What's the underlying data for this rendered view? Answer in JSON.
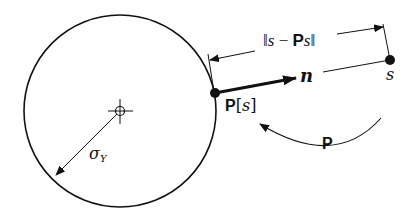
{
  "figure": {
    "colors": {
      "stroke": "#111111",
      "background": "#ffffff"
    },
    "circle": {
      "center": [
        120,
        111
      ],
      "radius": 96
    },
    "center_marker": {
      "icon": "crosshair-circle-icon"
    },
    "radius_label": {
      "symbol": "σ",
      "subscript": "Y"
    },
    "projected_point": {
      "label_bold": "P",
      "label_open": "[",
      "label_var": "s",
      "label_close": "]"
    },
    "normal_vector": {
      "label": "n"
    },
    "source_point": {
      "label": "s"
    },
    "distance_dimension": {
      "label_open": "‖",
      "label_s": "s",
      "label_minus": " − ",
      "label_P": "P",
      "label_s2": "s",
      "label_close": "‖"
    },
    "projection_operator": {
      "label": "P"
    }
  }
}
